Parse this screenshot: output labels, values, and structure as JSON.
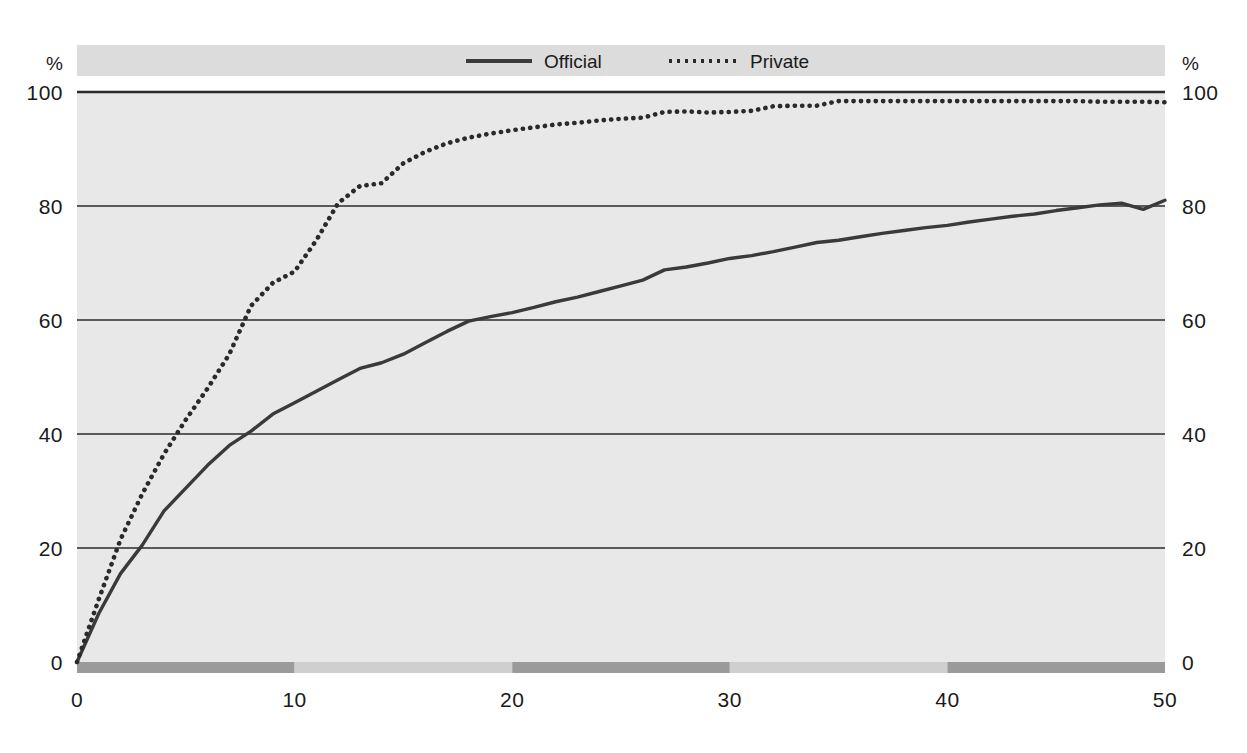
{
  "chart_data": {
    "type": "line",
    "title": "",
    "subtitle": "",
    "xlabel": "",
    "ylabel": "%",
    "ylabel_right": "%",
    "xlim": [
      0,
      50
    ],
    "ylim": [
      0,
      100
    ],
    "grid": true,
    "grid_axis": "y",
    "legend_position": "top-center",
    "x_ticks": [
      0,
      10,
      20,
      30,
      40,
      50
    ],
    "x_tick_labels": [
      "0",
      "10",
      "20",
      "30",
      "40",
      "50"
    ],
    "y_ticks": [
      0,
      20,
      40,
      60,
      80,
      100
    ],
    "y_tick_labels": [
      "0",
      "20",
      "40",
      "60",
      "80",
      "100"
    ],
    "y_ticks_right": [
      0,
      20,
      40,
      60,
      80,
      100
    ],
    "y_tick_labels_right": [
      "0",
      "20",
      "40",
      "60",
      "80",
      "100"
    ],
    "axis_band": {
      "segments": [
        {
          "from": 0,
          "to": 10,
          "shade": "dark"
        },
        {
          "from": 10,
          "to": 20,
          "shade": "light"
        },
        {
          "from": 20,
          "to": 30,
          "shade": "dark"
        },
        {
          "from": 30,
          "to": 40,
          "shade": "light"
        },
        {
          "from": 40,
          "to": 50,
          "shade": "dark"
        }
      ],
      "dark_color": "#9a9a9a",
      "light_color": "#cfcfcf"
    },
    "series": [
      {
        "name": "Official",
        "style": "solid",
        "color": "#3a3a3a",
        "x": [
          0,
          1,
          2,
          3,
          4,
          5,
          6,
          7,
          8,
          9,
          10,
          11,
          12,
          13,
          14,
          15,
          16,
          17,
          18,
          19,
          20,
          21,
          22,
          23,
          24,
          25,
          26,
          27,
          28,
          29,
          30,
          31,
          32,
          33,
          34,
          35,
          36,
          37,
          38,
          39,
          40,
          41,
          42,
          43,
          44,
          45,
          46,
          47,
          48,
          49,
          50
        ],
        "values": [
          0,
          8.5,
          15.5,
          20.5,
          26.5,
          30.5,
          34.5,
          38.0,
          40.5,
          43.5,
          45.5,
          47.5,
          49.5,
          51.5,
          52.5,
          54.0,
          56.0,
          58.0,
          59.8,
          60.6,
          61.3,
          62.2,
          63.2,
          64.0,
          65.0,
          66.0,
          67.0,
          68.8,
          69.3,
          70.0,
          70.8,
          71.3,
          72.0,
          72.8,
          73.6,
          74.0,
          74.6,
          75.2,
          75.7,
          76.2,
          76.6,
          77.2,
          77.7,
          78.2,
          78.6,
          79.2,
          79.7,
          80.2,
          80.5,
          79.4,
          81.0
        ]
      },
      {
        "name": "Private",
        "style": "dotted",
        "color": "#2a2a2a",
        "x": [
          0,
          1,
          2,
          3,
          4,
          5,
          6,
          7,
          8,
          9,
          10,
          11,
          12,
          13,
          14,
          15,
          16,
          17,
          18,
          19,
          20,
          21,
          22,
          23,
          24,
          25,
          26,
          27,
          28,
          29,
          30,
          31,
          32,
          33,
          34,
          35,
          36,
          37,
          38,
          39,
          40,
          41,
          42,
          43,
          44,
          45,
          46,
          47,
          48,
          49,
          50
        ],
        "values": [
          0,
          11.0,
          21.5,
          29.5,
          36.5,
          42.5,
          48.0,
          54.0,
          62.5,
          66.5,
          68.5,
          74.0,
          80.5,
          83.5,
          84.0,
          87.5,
          89.5,
          91.0,
          92.0,
          92.7,
          93.3,
          93.8,
          94.3,
          94.6,
          95.0,
          95.3,
          95.5,
          96.5,
          96.6,
          96.4,
          96.5,
          96.7,
          97.5,
          97.6,
          97.6,
          98.4,
          98.4,
          98.4,
          98.4,
          98.4,
          98.4,
          98.4,
          98.4,
          98.4,
          98.4,
          98.4,
          98.4,
          98.3,
          98.3,
          98.3,
          98.2
        ]
      }
    ],
    "legend": [
      {
        "label": "Official",
        "style": "solid"
      },
      {
        "label": "Private",
        "style": "dotted"
      }
    ]
  },
  "colors": {
    "plot_background": "#e8e8e8",
    "legend_background": "#dcdcdc",
    "gridline": "#2b2b2b",
    "text": "#1a1a1a"
  }
}
